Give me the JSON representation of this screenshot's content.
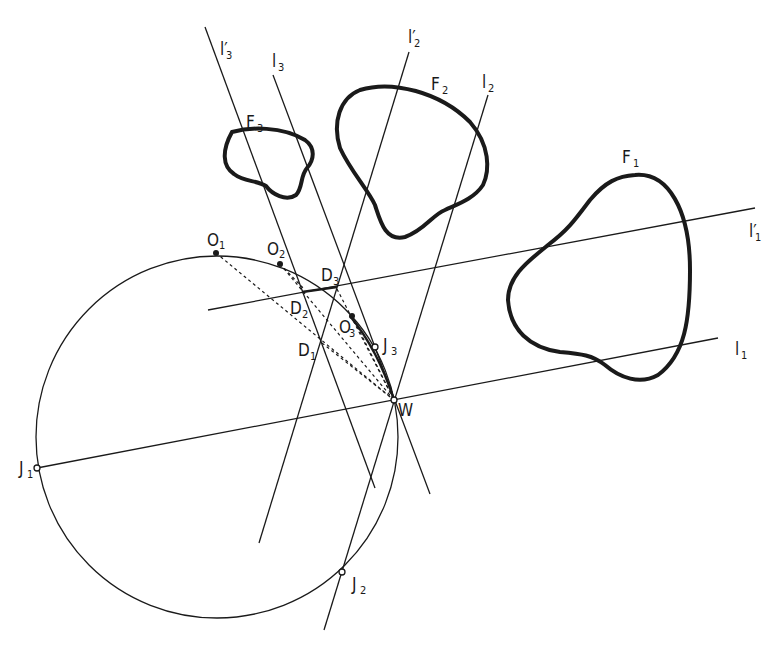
{
  "figure": {
    "figures": [
      {
        "id": "F1",
        "label": "F",
        "sub": "1"
      },
      {
        "id": "F2",
        "label": "F",
        "sub": "2"
      },
      {
        "id": "F3",
        "label": "F",
        "sub": "3"
      }
    ],
    "lines": [
      {
        "id": "l1",
        "label": "l",
        "sub": "1"
      },
      {
        "id": "l1p",
        "label": "l′",
        "sub": "1"
      },
      {
        "id": "l2",
        "label": "l",
        "sub": "2"
      },
      {
        "id": "l2p",
        "label": "l′",
        "sub": "2"
      },
      {
        "id": "l3",
        "label": "l",
        "sub": "3"
      },
      {
        "id": "l3p",
        "label": "l′",
        "sub": "3"
      }
    ],
    "points": [
      {
        "id": "O1",
        "label": "O",
        "sub": "1"
      },
      {
        "id": "O2",
        "label": "O",
        "sub": "2"
      },
      {
        "id": "O3",
        "label": "O",
        "sub": "3"
      },
      {
        "id": "D1",
        "label": "D",
        "sub": "1"
      },
      {
        "id": "D2",
        "label": "D",
        "sub": "2"
      },
      {
        "id": "D3",
        "label": "D",
        "sub": "3"
      },
      {
        "id": "J1",
        "label": "J",
        "sub": "1"
      },
      {
        "id": "J2",
        "label": "J",
        "sub": "2"
      },
      {
        "id": "J3",
        "label": "J",
        "sub": "3"
      },
      {
        "id": "W",
        "label": "W",
        "sub": ""
      }
    ]
  }
}
